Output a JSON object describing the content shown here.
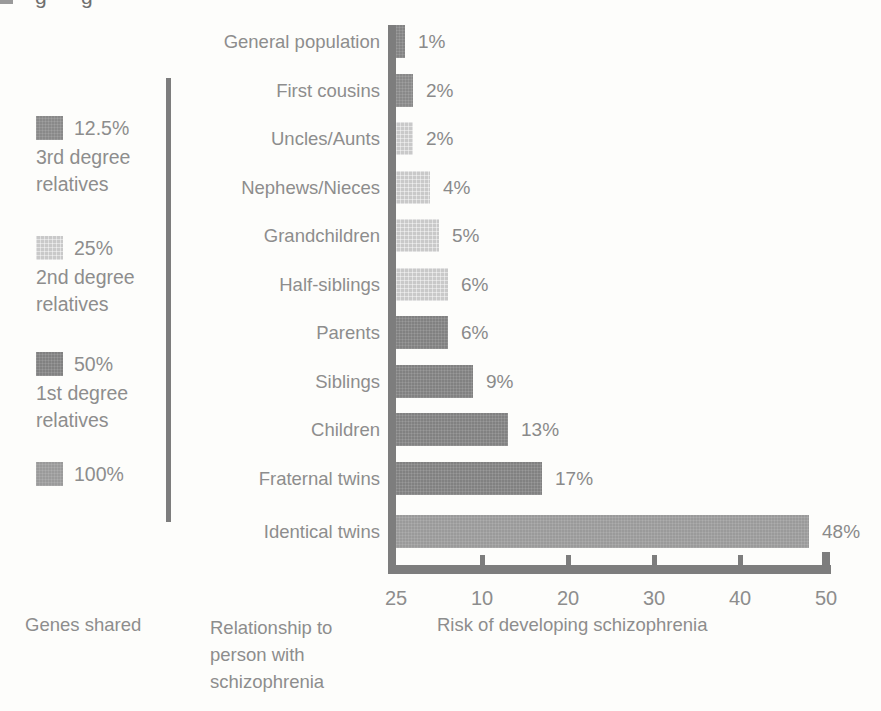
{
  "page": {
    "top_fragments": [
      "g",
      "g"
    ]
  },
  "legend": {
    "items": [
      {
        "pct": "12.5%",
        "sublabel": [
          "3rd degree",
          "relatives"
        ],
        "group": "third"
      },
      {
        "pct": "25%",
        "sublabel": [
          "2nd degree",
          "relatives"
        ],
        "group": "second"
      },
      {
        "pct": "50%",
        "sublabel": [
          "1st degree",
          "relatives"
        ],
        "group": "first"
      },
      {
        "pct": "100%",
        "sublabel": [],
        "group": "hundred"
      }
    ]
  },
  "footer": {
    "genes_shared": "Genes shared",
    "relationship": [
      "Relationship to",
      "person with",
      "schizophrenia"
    ],
    "risk_axis_label": "Risk of developing schizophrenia"
  },
  "chart_data": {
    "type": "bar",
    "orientation": "horizontal",
    "title": "",
    "xlabel": "Risk of developing schizophrenia",
    "ylabel": "Relationship to person with schizophrenia",
    "xlim": [
      0,
      52
    ],
    "grid": false,
    "categories": [
      "General population",
      "First cousins",
      "Uncles/Aunts",
      "Nephews/Nieces",
      "Grandchildren",
      "Half-siblings",
      "Parents",
      "Siblings",
      "Children",
      "Fraternal twins",
      "Identical twins"
    ],
    "values": [
      1,
      2,
      2,
      4,
      5,
      6,
      6,
      9,
      13,
      17,
      48
    ],
    "value_labels": [
      "1%",
      "2%",
      "2%",
      "4%",
      "5%",
      "6%",
      "6%",
      "9%",
      "13%",
      "17%",
      "48%"
    ],
    "groups": [
      "general",
      "third",
      "second",
      "second",
      "second",
      "second",
      "first",
      "first",
      "first",
      "first",
      "hundred"
    ],
    "group_meaning": {
      "third": "12.5% genes shared - 3rd degree relatives",
      "second": "25% genes shared - 2nd degree relatives",
      "first": "50% genes shared - 1st degree relatives",
      "hundred": "100% genes shared"
    },
    "palette": {
      "general": "#848484",
      "third": "#898989",
      "second": "#c9c9c9",
      "first": "#818181",
      "hundred": "#9a9a9a"
    },
    "axis_color": "#7d7d7d",
    "x_ticks": [
      {
        "label": "25",
        "pos": 0,
        "mark": false,
        "end": false
      },
      {
        "label": "10",
        "pos": 10,
        "mark": true,
        "end": false
      },
      {
        "label": "20",
        "pos": 20,
        "mark": true,
        "end": false
      },
      {
        "label": "30",
        "pos": 30,
        "mark": true,
        "end": false
      },
      {
        "label": "40",
        "pos": 40,
        "mark": true,
        "end": true
      }
    ],
    "x_tick_last": {
      "label": "50",
      "pos": 50,
      "mark": true,
      "end": true
    }
  }
}
